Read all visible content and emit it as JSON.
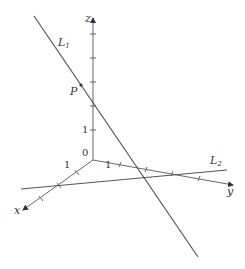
{
  "diagram": {
    "type": "3d-axes-skew-lines",
    "axes": {
      "x_label": "x",
      "y_label": "y",
      "z_label": "z",
      "origin_label": "0",
      "x_tick_label": "1",
      "y_tick_label": "1",
      "z_tick_label": "1"
    },
    "lines": [
      {
        "name": "L",
        "subscript": "1"
      },
      {
        "name": "L",
        "subscript": "2"
      }
    ],
    "points": [
      {
        "label": "P"
      }
    ],
    "colors": {
      "stroke": "#555555",
      "text": "#333333",
      "background": "#ffffff"
    }
  }
}
